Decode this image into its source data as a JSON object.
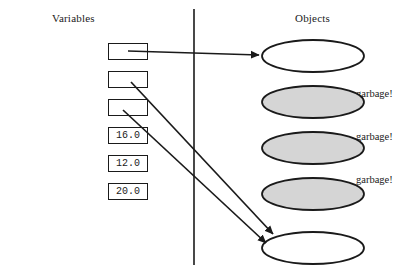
{
  "diagram": {
    "title_variables": "Variables",
    "title_objects": "Objects",
    "divider": {
      "x": 194,
      "y_top": 9,
      "y_bottom": 265
    },
    "colors": {
      "stroke": "#1a1a1a",
      "object_fill_live": "#ffffff",
      "object_fill_garbage": "#d5d5d5",
      "background": "#ffffff"
    }
  },
  "variables": [
    {
      "name": "firstCity",
      "value": "",
      "has_value": false,
      "top": 43,
      "arrow": "to-city-1"
    },
    {
      "name": "currentCity",
      "value": "",
      "has_value": false,
      "top": 71,
      "arrow": "to-city-5"
    },
    {
      "name": "nextCity",
      "value": "",
      "has_value": false,
      "top": 99,
      "arrow": "to-city-5"
    },
    {
      "name": "x",
      "value": "16.0",
      "has_value": true,
      "top": 127,
      "arrow": "none"
    },
    {
      "name": "y",
      "value": "12.0",
      "has_value": true,
      "top": 155,
      "arrow": "none"
    },
    {
      "name": "distance",
      "value": "20.0",
      "has_value": true,
      "top": 183,
      "arrow": "none"
    }
  ],
  "objects": [
    {
      "label": "city 1",
      "cx": 313,
      "cy": 56,
      "rx": 51,
      "ry": 16,
      "garbage": false,
      "garbage_label": ""
    },
    {
      "label": "city 2",
      "cx": 313,
      "cy": 102,
      "rx": 51,
      "ry": 16,
      "garbage": true,
      "garbage_label": "garbage!"
    },
    {
      "label": "city 3",
      "cx": 313,
      "cy": 148,
      "rx": 51,
      "ry": 16,
      "garbage": true,
      "garbage_label": "garbage!"
    },
    {
      "label": "city 4",
      "cx": 313,
      "cy": 194,
      "rx": 51,
      "ry": 16,
      "garbage": true,
      "garbage_label": "garbage!"
    },
    {
      "label": "city 5",
      "cx": 313,
      "cy": 248,
      "rx": 51,
      "ry": 16,
      "garbage": false,
      "garbage_label": ""
    }
  ],
  "garbage_labels": [
    {
      "text": "garbage!",
      "left": 356,
      "top": 88
    },
    {
      "text": "garbage!",
      "left": 356,
      "top": 131
    },
    {
      "text": "garbage!",
      "left": 356,
      "top": 174
    }
  ],
  "arrows": [
    {
      "from": "firstCity",
      "to": "city 1",
      "x1": 128,
      "y1": 51,
      "x2": 259,
      "y2": 55
    },
    {
      "from": "currentCity",
      "to": "city 5",
      "x1": 131,
      "y1": 82,
      "x2": 273,
      "y2": 234
    },
    {
      "from": "nextCity",
      "to": "city 5",
      "x1": 123,
      "y1": 110,
      "x2": 266,
      "y2": 243
    }
  ]
}
